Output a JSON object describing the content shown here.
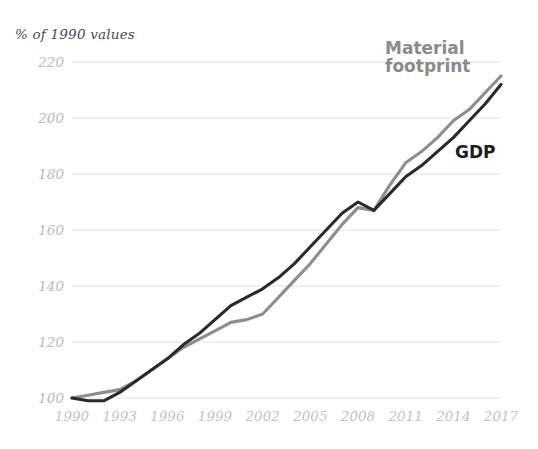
{
  "chart_data": {
    "type": "line",
    "title": "",
    "subtitle": "",
    "ylabel": "% of 1990 values",
    "xlabel": "",
    "ylim": [
      100,
      220
    ],
    "yticks": [
      100,
      120,
      140,
      160,
      180,
      200,
      220
    ],
    "xlim": [
      1990,
      2017
    ],
    "xticks": [
      1990,
      1993,
      1996,
      1999,
      2002,
      2005,
      2008,
      2011,
      2014,
      2017
    ],
    "xtick_labels": [
      "1990",
      "1993",
      "1996",
      "1999",
      "2002",
      "2005",
      "2008",
      "2011",
      "2014",
      "2017"
    ],
    "ytick_labels": [
      "100",
      "120",
      "140",
      "160",
      "180",
      "200",
      "220"
    ],
    "grid": "horizontal",
    "legend_position": "inline-right",
    "x": [
      1990,
      1991,
      1992,
      1993,
      1994,
      1995,
      1996,
      1997,
      1998,
      1999,
      2000,
      2001,
      2002,
      2003,
      2004,
      2005,
      2006,
      2007,
      2008,
      2009,
      2010,
      2011,
      2012,
      2013,
      2014,
      2015,
      2016,
      2017
    ],
    "series": [
      {
        "name": "Material footprint",
        "color": "#8a8a8a",
        "values": [
          100,
          101,
          102,
          103,
          106,
          110,
          114,
          118,
          121,
          124,
          127,
          128,
          130,
          136,
          142,
          148,
          155,
          162,
          168,
          167,
          176,
          184,
          188,
          193,
          199,
          203,
          209,
          215
        ]
      },
      {
        "name": "GDP",
        "color": "#1c1c1c",
        "values": [
          100,
          99,
          99,
          102,
          106,
          110,
          114,
          119,
          123,
          128,
          133,
          136,
          139,
          143,
          148,
          154,
          160,
          166,
          170,
          167,
          173,
          179,
          183,
          188,
          193,
          199,
          205,
          212
        ]
      }
    ],
    "annotations": [
      {
        "name": "Material footprint",
        "text": "Material\nfootprint",
        "color": "#8a8a8a"
      },
      {
        "name": "GDP",
        "text": "GDP",
        "color": "#1c1c1c"
      }
    ]
  },
  "labels": {
    "axis_note": "% of 1990 values",
    "footprint": "Material\nfootprint",
    "gdp": "GDP"
  }
}
